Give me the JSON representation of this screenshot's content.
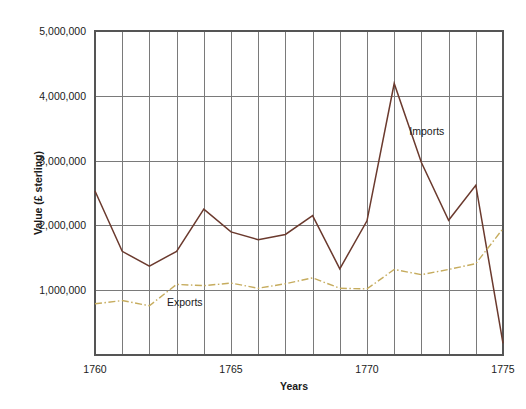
{
  "chart_data": {
    "type": "line",
    "title": "",
    "xlabel": "Years",
    "ylabel": "Value (£ sterling)",
    "x": [
      1760,
      1761,
      1762,
      1763,
      1764,
      1765,
      1766,
      1767,
      1768,
      1769,
      1770,
      1771,
      1772,
      1773,
      1774,
      1775
    ],
    "xlim": [
      1760,
      1775
    ],
    "ylim": [
      0,
      5000000
    ],
    "xticks": [
      1760,
      1765,
      1770,
      1775
    ],
    "xtick_labels": [
      "1760",
      "1765",
      "1770",
      "1775"
    ],
    "yticks": [
      1000000,
      2000000,
      3000000,
      4000000,
      5000000
    ],
    "ytick_labels": [
      "1,000,000",
      "2,000,000",
      "3,000,000",
      "4,000,000",
      "5,000,000"
    ],
    "grid": true,
    "grid_axis": "both",
    "legend": "inline-annotations",
    "series": [
      {
        "name": "Imports",
        "color": "#6B3A2E",
        "linestyle": "solid",
        "linewidth": 1.5,
        "values": [
          2530000,
          1600000,
          1370000,
          1600000,
          2250000,
          1900000,
          1780000,
          1860000,
          2150000,
          1330000,
          2070000,
          4190000,
          2970000,
          2080000,
          2620000,
          180000
        ]
      },
      {
        "name": "Exports",
        "color": "#C6AC5E",
        "linestyle": "dashdot",
        "linewidth": 1.4,
        "values": [
          790000,
          840000,
          760000,
          1090000,
          1070000,
          1110000,
          1030000,
          1100000,
          1190000,
          1030000,
          1020000,
          1320000,
          1240000,
          1320000,
          1410000,
          1950000
        ]
      }
    ],
    "annotations": [
      {
        "text": "Imports",
        "x": 1772.2,
        "y": 3400000
      },
      {
        "text": "Exports",
        "x": 1763.3,
        "y": 760000
      }
    ]
  }
}
